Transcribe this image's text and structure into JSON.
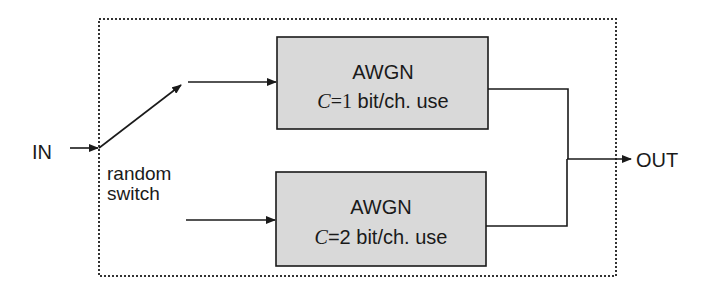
{
  "diagram": {
    "type": "block-diagram",
    "input_label": "IN",
    "output_label": "OUT",
    "switch": {
      "label_line1": "random",
      "label_line2": "switch"
    },
    "blocks": [
      {
        "title": "AWGN",
        "capacity_symbol": "C",
        "capacity_value": "=1",
        "capacity_unit": " bit/ch. use"
      },
      {
        "title": "AWGN",
        "capacity_symbol": "C",
        "capacity_value": "=2",
        "capacity_unit": " bit/ch. use"
      }
    ],
    "colors": {
      "block_fill": "#d9d9d9",
      "line": "#1a1a1a",
      "background": "#ffffff"
    }
  }
}
